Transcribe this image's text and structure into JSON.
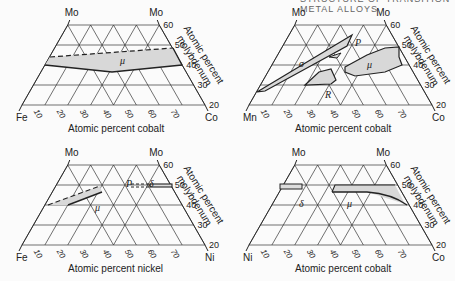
{
  "header": {
    "text": "STRUCTURE OF TRANSITION-METAL ALLOYS"
  },
  "panels": [
    {
      "id": "fe-mo-co",
      "corner_left": "Fe",
      "corner_right": "Co",
      "top_left": "Mo",
      "top_right": "Mo",
      "xlabel": "Atomic percent cobalt",
      "ylabel": "Atomic percent molybdenum",
      "x_ticks": [
        "10",
        "20",
        "30",
        "40",
        "50",
        "60",
        "70"
      ],
      "y_ticks": [
        "60",
        "50",
        "40",
        "30",
        "20"
      ],
      "phases": [
        "μ"
      ]
    },
    {
      "id": "mn-mo-co",
      "corner_left": "Mn",
      "corner_right": "Co",
      "top_left": "Mo",
      "top_right": "Mo",
      "xlabel": "Atomic percent cobalt",
      "ylabel": "Atomic percent molybdenum",
      "x_ticks": [
        "10",
        "20",
        "30",
        "40",
        "50",
        "60",
        "70"
      ],
      "y_ticks": [
        "60",
        "50",
        "40",
        "30",
        "20"
      ],
      "phases": [
        "σ",
        "P",
        "μ",
        "R"
      ]
    },
    {
      "id": "fe-mo-ni",
      "corner_left": "Fe",
      "corner_right": "Ni",
      "top_left": "Mo",
      "top_right": "Mo",
      "xlabel": "Atomic percent nickel",
      "ylabel": "Atomic percent molybdenum",
      "x_ticks": [
        "10",
        "20",
        "30",
        "40",
        "50",
        "60",
        "70"
      ],
      "y_ticks": [
        "60",
        "50",
        "40",
        "30",
        "20"
      ],
      "phases": [
        "μ",
        "P",
        "δ"
      ]
    },
    {
      "id": "ni-mo-co",
      "corner_left": "Ni",
      "corner_right": "Co",
      "top_left": "Mo",
      "top_right": "Mo",
      "xlabel": "Atomic percent cobalt",
      "ylabel": "Atomic percent molybdenum",
      "x_ticks": [
        "10",
        "20",
        "30",
        "40",
        "50",
        "60",
        "70"
      ],
      "y_ticks": [
        "60",
        "50",
        "40",
        "30",
        "20"
      ],
      "phases": [
        "δ",
        "μ"
      ]
    }
  ]
}
